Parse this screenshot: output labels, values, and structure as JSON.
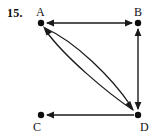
{
  "figure": {
    "problem_number": "15.",
    "kind": "directed-graph",
    "stroke_color": "#1a1a1a",
    "background_color": "#ffffff",
    "width": 155,
    "height": 137
  },
  "vertices": [
    {
      "id": "A",
      "label": "A",
      "x": 41,
      "y": 23
    },
    {
      "id": "B",
      "label": "B",
      "x": 138,
      "y": 23
    },
    {
      "id": "C",
      "label": "C",
      "x": 41,
      "y": 115
    },
    {
      "id": "D",
      "label": "D",
      "x": 138,
      "y": 115
    }
  ],
  "edges": [
    {
      "id": "edge-a-b",
      "from": "A",
      "to": "B",
      "shape": "straight",
      "direction": "both"
    },
    {
      "id": "edge-b-d",
      "from": "B",
      "to": "D",
      "shape": "straight",
      "direction": "both"
    },
    {
      "id": "edge-d-c",
      "from": "D",
      "to": "C",
      "shape": "straight",
      "direction": "forward"
    },
    {
      "id": "edge-a-d-outer",
      "from": "A",
      "to": "D",
      "shape": "curved",
      "direction": "forward"
    },
    {
      "id": "edge-d-a-inner",
      "from": "D",
      "to": "A",
      "shape": "curved",
      "direction": "forward"
    }
  ]
}
